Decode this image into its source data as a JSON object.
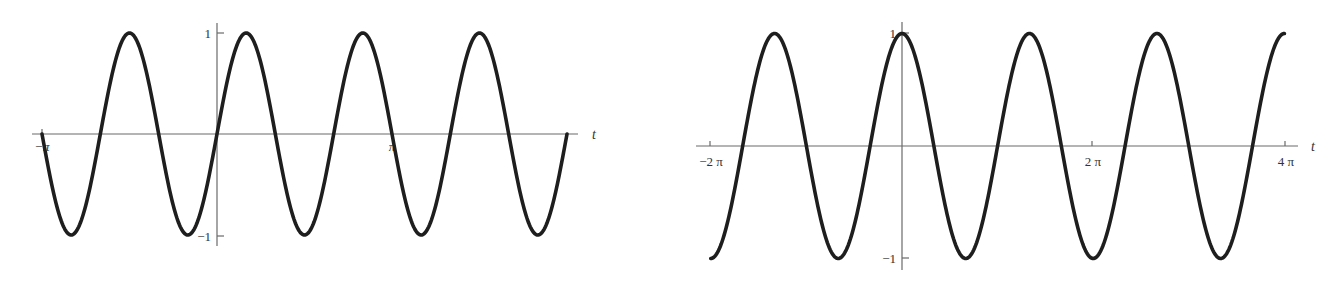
{
  "chart_data": [
    {
      "type": "line",
      "title": "",
      "function": "sin(3t)",
      "xlabel": "t",
      "ylabel": "",
      "xlim": [
        -3.14159,
        6.28318
      ],
      "ylim": [
        -1,
        1
      ],
      "grid": false,
      "legend": null,
      "x_tick_labels": [
        "-π",
        "π"
      ],
      "x_ticks": [
        -3.14159,
        3.14159
      ],
      "y_tick_labels": [
        "1",
        "-1"
      ],
      "y_ticks": [
        1,
        -1
      ],
      "series": [
        {
          "name": "sin(3t)",
          "x": [
            -3.1416,
            -2.618,
            -2.0944,
            -1.5708,
            -1.0472,
            -0.5236,
            0,
            0.5236,
            1.0472,
            1.5708,
            2.0944,
            2.618,
            3.1416,
            3.6652,
            4.1888,
            4.7124,
            5.236,
            5.7596,
            6.2832
          ],
          "values": [
            0,
            -1,
            0,
            1,
            0,
            -1,
            0,
            1,
            0,
            -1,
            0,
            1,
            0,
            -1,
            0,
            1,
            0,
            -1,
            0
          ]
        }
      ]
    },
    {
      "type": "line",
      "title": "",
      "function": "cos(1.5t)",
      "xlabel": "t",
      "ylabel": "",
      "xlim": [
        -6.28318,
        12.56637
      ],
      "ylim": [
        -1,
        1
      ],
      "grid": false,
      "legend": null,
      "x_tick_labels": [
        "-2π",
        "2π",
        "4π"
      ],
      "x_ticks": [
        -6.28318,
        6.28318,
        12.56637
      ],
      "y_tick_labels": [
        "1",
        "-1"
      ],
      "y_ticks": [
        1,
        -1
      ],
      "series": [
        {
          "name": "cos(1.5t)",
          "x": [
            -6.2832,
            -4.1888,
            -2.0944,
            0,
            2.0944,
            4.1888,
            6.2832,
            8.3776,
            10.472,
            12.5664
          ],
          "values": [
            -1,
            1,
            -1,
            1,
            -1,
            1,
            -1,
            1,
            -1,
            1
          ]
        }
      ]
    }
  ],
  "left_chart": {
    "t_label": "t",
    "xtick_neg_pi": "−π",
    "xtick_pi": "π",
    "ytick_pos": "1",
    "ytick_neg": "−1",
    "t_min_pi": -1,
    "t_max_pi": 2,
    "freq": 3,
    "func": "sin"
  },
  "right_chart": {
    "t_label": "t",
    "xtick_neg_2pi": "−2 π",
    "xtick_2pi": "2 π",
    "xtick_4pi": "4 π",
    "ytick_pos": "1",
    "ytick_neg": "−1",
    "t_min_pi": -2,
    "t_max_pi": 4,
    "freq": 1.5,
    "func": "cos"
  },
  "colors": {
    "curve": "#1e1e1e",
    "axis": "#6a6a6a",
    "background": "#ffffff"
  }
}
